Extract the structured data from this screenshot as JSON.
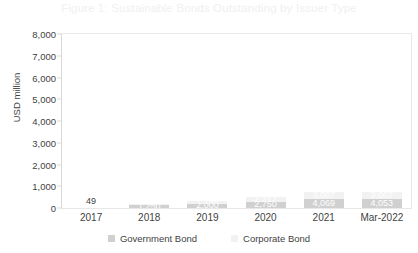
{
  "chart_data": {
    "type": "bar",
    "subtype": "stacked-bar",
    "title": "Figure 1: Sustainable Bonds Outstanding by Issuer Type",
    "xlabel": "",
    "ylabel": "USD million",
    "ylim": [
      0,
      8000
    ],
    "ytick_values": [
      8000,
      7000,
      6000,
      5000,
      4000,
      3000,
      2000,
      1000,
      0
    ],
    "ytick_labels": [
      "8,000",
      "7,000",
      "6,000",
      "5,000",
      "4,000",
      "3,000",
      "2,000",
      "1,000",
      "0"
    ],
    "grid": false,
    "legend_position": "bottom",
    "categories": [
      "2017",
      "2018",
      "2019",
      "2020",
      "2021",
      "Mar-2022"
    ],
    "series": [
      {
        "name": "Government Bond",
        "color": "#d0d0d0",
        "values": [
          49,
          1250,
          2000,
          2750,
          4069,
          4053
        ],
        "labels": [
          "49",
          "1,250",
          "2,000",
          "2,750",
          "4,069",
          "4,053"
        ]
      },
      {
        "name": "Corporate Bond",
        "color": "#f2f2f2",
        "values": [
          0,
          653,
          1155,
          2217,
          3007,
          3007
        ],
        "labels": [
          "",
          "653",
          "1,155",
          "2,217",
          "3,007",
          "3,007"
        ]
      }
    ],
    "totals": [
      49,
      1903,
      3155,
      4967,
      7076,
      7060
    ]
  },
  "bars": [
    {
      "category": "2017",
      "government_label": "49",
      "government_pct": 0.6125,
      "corporate_label": "",
      "corporate_pct": 0,
      "label_outside": true
    },
    {
      "category": "2018",
      "government_label": "1,250",
      "government_pct": 15.625,
      "corporate_label": "653",
      "corporate_pct": 8.1625,
      "label_outside": false
    },
    {
      "category": "2019",
      "government_label": "2,000",
      "government_pct": 25.0,
      "corporate_label": "1,155",
      "corporate_pct": 14.4375,
      "label_outside": false
    },
    {
      "category": "2020",
      "government_label": "2,750",
      "government_pct": 34.375,
      "corporate_label": "2,217",
      "corporate_pct": 27.7125,
      "label_outside": false
    },
    {
      "category": "2021",
      "government_label": "4,069",
      "government_pct": 50.8625,
      "corporate_label": "3,007",
      "corporate_pct": 37.5875,
      "label_outside": false
    },
    {
      "category": "Mar-2022",
      "government_label": "4,053",
      "government_pct": 50.6625,
      "corporate_label": "3,007",
      "corporate_pct": 37.5875,
      "label_outside": false
    }
  ],
  "legend": {
    "items": [
      {
        "label": "Government Bond",
        "color": "#d0d0d0"
      },
      {
        "label": "Corporate Bond",
        "color": "#f2f2f2"
      }
    ]
  },
  "colors": {
    "government_bond": "#d0d0d0",
    "corporate_bond": "#f2f2f2",
    "axis_text": "#3f3f3f",
    "title_text": "#f0f0f0",
    "frame": "#e8e8e8"
  }
}
